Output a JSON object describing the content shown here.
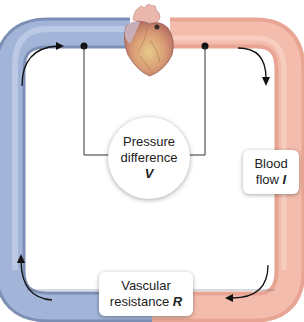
{
  "diagram": {
    "nodes": {
      "heart": {
        "label": "",
        "icon": "heart-icon"
      },
      "pressure": {
        "line1": "Pressure",
        "line2": "difference",
        "symbol": "V"
      },
      "flow": {
        "line1": "Blood",
        "line2": "flow",
        "symbol": "I"
      },
      "resistance": {
        "line1": "Vascular",
        "line2": "resistance",
        "symbol": "R"
      }
    },
    "colors": {
      "venous_blue": "#9aaed4",
      "arterial_pink": "#f0b3a3",
      "line": "#333333"
    }
  }
}
